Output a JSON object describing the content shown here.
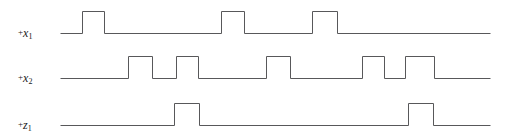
{
  "diagram": {
    "type": "digital-timing-waveform",
    "title": "",
    "background_color": "#ffffff",
    "trace_color": "#58585a",
    "label_color": "#1a1a1a",
    "axis": {
      "x_start": 60,
      "x_end": 490,
      "pulse_height": 22,
      "grid": false
    },
    "channels": [
      {
        "id": "x1",
        "label_sign": "+",
        "label_var": "x",
        "label_sub": "1",
        "label_text": "+x1",
        "label_x": 18,
        "label_y": 26,
        "baseline_y": 33,
        "top_y": 11,
        "pulses": [
          {
            "start": 82,
            "end": 104
          },
          {
            "start": 221,
            "end": 244
          },
          {
            "start": 312,
            "end": 337
          }
        ]
      },
      {
        "id": "x2",
        "label_sign": "+",
        "label_var": "x",
        "label_sub": "2",
        "label_text": "+x2",
        "label_x": 18,
        "label_y": 71,
        "baseline_y": 78,
        "top_y": 56,
        "pulses": [
          {
            "start": 128,
            "end": 152
          },
          {
            "start": 176,
            "end": 198
          },
          {
            "start": 266,
            "end": 290
          },
          {
            "start": 362,
            "end": 384
          },
          {
            "start": 405,
            "end": 434
          }
        ]
      },
      {
        "id": "z1",
        "label_sign": "+",
        "label_var": "z",
        "label_sub": "1",
        "label_text": "+z1",
        "label_x": 18,
        "label_y": 118,
        "baseline_y": 125,
        "top_y": 103,
        "pulses": [
          {
            "start": 174,
            "end": 199
          },
          {
            "start": 408,
            "end": 433
          }
        ]
      }
    ]
  }
}
